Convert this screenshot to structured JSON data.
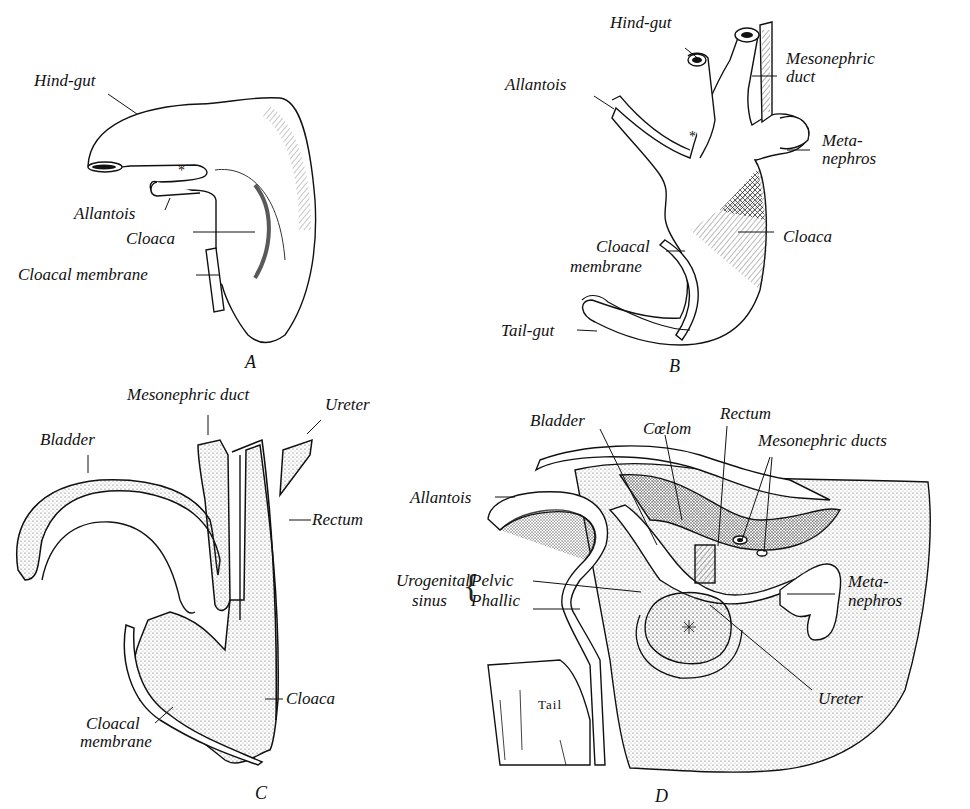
{
  "figure": {
    "panels": [
      {
        "id": "A",
        "caption": "A",
        "labels": {
          "hindgut": "Hind-gut",
          "allantois": "Allantois",
          "cloaca": "Cloaca",
          "cloacal_membrane": "Cloacal membrane",
          "asterisk": "*"
        }
      },
      {
        "id": "B",
        "caption": "B",
        "labels": {
          "hindgut": "Hind-gut",
          "allantois": "Allantois",
          "mesonephric_duct_1": "Mesonephric",
          "mesonephric_duct_2": "duct",
          "metanephros_1": "Meta-",
          "metanephros_2": "nephros",
          "cloaca": "Cloaca",
          "cloacal_membrane_1": "Cloacal",
          "cloacal_membrane_2": "membrane",
          "tailgut": "Tail-gut",
          "asterisk": "*"
        }
      },
      {
        "id": "C",
        "caption": "C",
        "labels": {
          "mesonephric_duct": "Mesonephric duct",
          "ureter": "Ureter",
          "bladder": "Bladder",
          "rectum": "Rectum",
          "cloaca": "Cloaca",
          "cloacal_membrane_1": "Cloacal",
          "cloacal_membrane_2": "membrane"
        }
      },
      {
        "id": "D",
        "caption": "D",
        "labels": {
          "bladder": "Bladder",
          "coelom": "Cœlom",
          "rectum": "Rectum",
          "mesonephric_ducts": "Mesonephric ducts",
          "allantois": "Allantois",
          "urogenital_1": "Urogenital",
          "urogenital_2": "sinus",
          "pelvic": "Pelvic",
          "phallic": "Phallic",
          "metanephros_1": "Meta-",
          "metanephros_2": "nephros",
          "ureter": "Ureter",
          "tail": "Tail"
        }
      }
    ]
  }
}
